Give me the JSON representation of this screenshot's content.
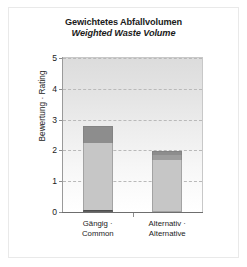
{
  "chart_data": {
    "type": "bar",
    "title": "Gewichtetes Abfallvolumen",
    "subtitle": "Weighted Waste Volume",
    "xlabel": "",
    "ylabel": "Bewertung · Rating",
    "ylim": [
      0,
      5
    ],
    "yticks": [
      0,
      1,
      2,
      3,
      4,
      5
    ],
    "ytick_labels": [
      "0",
      "1",
      "2",
      "3",
      "4",
      "5"
    ],
    "grid": true,
    "grid_axis": "y",
    "legend": "none",
    "stacked": true,
    "categories": [
      "Gängig · Common",
      "Alternativ · Alternative"
    ],
    "category_lines": [
      [
        "Gängig ·",
        "Common"
      ],
      [
        "Alternativ ·",
        "Alternative"
      ]
    ],
    "totals": [
      2.78,
      1.99
    ],
    "series": [
      {
        "name": "segment-base",
        "values": [
          0.07,
          0.0
        ],
        "color": "#4d4d4d"
      },
      {
        "name": "segment-body",
        "values": [
          2.16,
          1.68
        ],
        "color": "#c6c6c6"
      },
      {
        "name": "segment-mid",
        "values": [
          0.0,
          0.17
        ],
        "color": "#9d9d9d"
      },
      {
        "name": "segment-cap",
        "values": [
          0.55,
          0.14
        ],
        "color": "#8d8d8d"
      }
    ],
    "bar_segments": [
      {
        "category": "Gängig · Common",
        "total": 2.78,
        "segments": [
          {
            "name": "base",
            "from": 0.0,
            "to": 0.07,
            "color": "#4d4d4d"
          },
          {
            "name": "body",
            "from": 0.07,
            "to": 2.23,
            "color": "#c6c6c6"
          },
          {
            "name": "cap",
            "from": 2.23,
            "to": 2.78,
            "color": "#8d8d8d"
          }
        ]
      },
      {
        "category": "Alternativ · Alternative",
        "total": 1.99,
        "segments": [
          {
            "name": "body",
            "from": 0.0,
            "to": 1.68,
            "color": "#c6c6c6"
          },
          {
            "name": "mid",
            "from": 1.68,
            "to": 1.85,
            "color": "#9d9d9d"
          },
          {
            "name": "cap",
            "from": 1.85,
            "to": 1.99,
            "color": "#8d8d8d"
          }
        ]
      }
    ]
  }
}
